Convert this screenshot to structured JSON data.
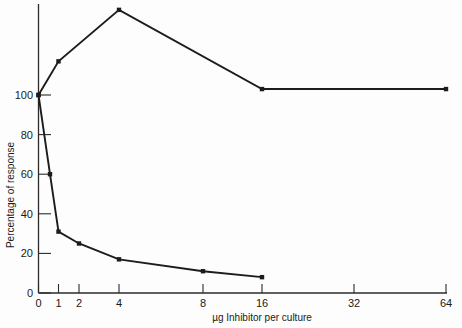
{
  "chart_data": {
    "type": "line",
    "title": "",
    "subtitle": "",
    "xlabel": "µg Inhibitor per culture",
    "ylabel": "Percentage of response",
    "x_scale": "log2-like (0 then doubling)",
    "x_tick_labels": [
      "0",
      "1",
      "2",
      "4",
      "8",
      "16",
      "32",
      "64"
    ],
    "x_tick_values": [
      0,
      1,
      2,
      4,
      8,
      16,
      32,
      64
    ],
    "y_tick_labels": [
      "0",
      "20",
      "40",
      "60",
      "80",
      "100"
    ],
    "y_tick_values": [
      0,
      20,
      40,
      60,
      80,
      100
    ],
    "ylim": [
      0,
      145
    ],
    "grid": false,
    "legend": "none",
    "annotations": [],
    "series": [
      {
        "name": "stimulation curve",
        "marker": "square",
        "color": "#1c1c1c",
        "points": [
          {
            "x": 0,
            "y": 100
          },
          {
            "x": 1,
            "y": 117
          },
          {
            "x": 4,
            "y": 143
          },
          {
            "x": 16,
            "y": 103
          },
          {
            "x": 64,
            "y": 103
          }
        ]
      },
      {
        "name": "inhibition curve",
        "marker": "square",
        "color": "#1c1c1c",
        "points": [
          {
            "x": 0,
            "y": 100
          },
          {
            "x": 0.6,
            "y": 60
          },
          {
            "x": 1,
            "y": 31
          },
          {
            "x": 2,
            "y": 25
          },
          {
            "x": 4,
            "y": 17
          },
          {
            "x": 8,
            "y": 11
          },
          {
            "x": 16,
            "y": 8
          }
        ]
      }
    ]
  },
  "axes": {
    "x_title": "µg Inhibitor per culture",
    "y_title": "Percentage of response",
    "x_ticks": [
      {
        "label": "0"
      },
      {
        "label": "1"
      },
      {
        "label": "2"
      },
      {
        "label": "4"
      },
      {
        "label": "8"
      },
      {
        "label": "16"
      },
      {
        "label": "32"
      },
      {
        "label": "64"
      }
    ],
    "y_ticks": [
      {
        "label": "0"
      },
      {
        "label": "20"
      },
      {
        "label": "40"
      },
      {
        "label": "60"
      },
      {
        "label": "80"
      },
      {
        "label": "100"
      }
    ]
  },
  "colors": {
    "background": "#fdfdfd",
    "axis": "#2b2b2b",
    "series": "#1c1c1c"
  }
}
